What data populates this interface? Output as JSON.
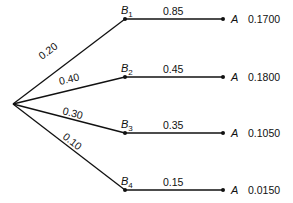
{
  "diagram": {
    "type": "probability-tree",
    "root": {
      "x": 13,
      "y": 104
    },
    "first_level": [
      {
        "node": "B",
        "sub": "1",
        "prob": "0.20",
        "x": 125,
        "y": 19,
        "label_x": 42,
        "label_y": 60,
        "label_angle": -37
      },
      {
        "node": "B",
        "sub": "2",
        "prob": "0.40",
        "x": 125,
        "y": 77,
        "label_x": 60,
        "label_y": 85,
        "label_angle": -14
      },
      {
        "node": "B",
        "sub": "3",
        "prob": "0.30",
        "x": 125,
        "y": 133,
        "label_x": 62,
        "label_y": 114,
        "label_angle": 15
      },
      {
        "node": "B",
        "sub": "4",
        "prob": "0.10",
        "x": 125,
        "y": 190,
        "label_x": 62,
        "label_y": 138,
        "label_angle": 38
      }
    ],
    "second_level": [
      {
        "prob": "0.85",
        "node": "A",
        "joint": "0.1700",
        "x": 223,
        "y": 19
      },
      {
        "prob": "0.45",
        "node": "A",
        "joint": "0.1800",
        "x": 223,
        "y": 77
      },
      {
        "prob": "0.35",
        "node": "A",
        "joint": "0.1050",
        "x": 223,
        "y": 133
      },
      {
        "prob": "0.15",
        "node": "A",
        "joint": "0.0150",
        "x": 223,
        "y": 190
      }
    ]
  }
}
